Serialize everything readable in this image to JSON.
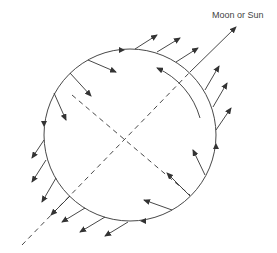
{
  "diagram": {
    "label": "Moon or Sun",
    "stroke_color": "#333333",
    "circle": {
      "cx": 130,
      "cy": 135,
      "r": 86
    }
  }
}
